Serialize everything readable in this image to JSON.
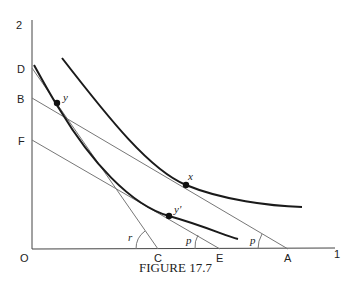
{
  "figure": {
    "caption": "FIGURE 17.7",
    "axis": {
      "origin_label": "O",
      "y_top_label": "2",
      "x_end_label": "1"
    },
    "y_axis_points": [
      {
        "label": "D"
      },
      {
        "label": "B"
      },
      {
        "label": "F"
      }
    ],
    "x_axis_points": [
      {
        "label": "C"
      },
      {
        "label": "E"
      },
      {
        "label": "A"
      }
    ],
    "lines": [
      {
        "from": "D",
        "to": "C",
        "angle_label": "r"
      },
      {
        "from": "B",
        "to": "A",
        "angle_label": "p"
      },
      {
        "from": "F",
        "to": "E",
        "angle_label": "p"
      }
    ],
    "curves": [
      {
        "name": "upper-indifference-curve",
        "points": [
          "x"
        ]
      },
      {
        "name": "lower-indifference-curve",
        "points": [
          "y",
          "y'"
        ]
      }
    ],
    "point_labels": {
      "x": "x",
      "y": "y",
      "y_prime": "y'"
    },
    "angle_labels": {
      "r": "r",
      "p_left": "p",
      "p_right": "p"
    }
  }
}
